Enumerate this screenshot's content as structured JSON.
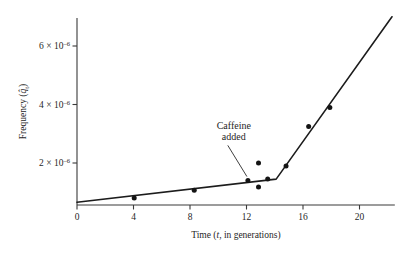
{
  "chart_data": {
    "type": "scatter",
    "title": "",
    "xlabel": "Time (t, in generations)",
    "xlabel_parts": {
      "prefix": "Time (",
      "italic": "t",
      "suffix": ", in generations)"
    },
    "ylabel": "Frequency (q̂t)",
    "ylabel_parts": {
      "prefix": "Frequency (",
      "italic": "q̂",
      "subscript": "t",
      "suffix": ")"
    },
    "xlim": [
      0,
      22.5
    ],
    "ylim": [
      0,
      7.2e-06
    ],
    "xticks": [
      0,
      4,
      8,
      12,
      16,
      20
    ],
    "xticklabels": [
      "0",
      "4",
      "8",
      "12",
      "16",
      "20"
    ],
    "yticks": [
      2e-06,
      4e-06,
      6e-06
    ],
    "yticklabels": [
      "2 × 10–6",
      "4 × 10–6",
      "6 × 10–6"
    ],
    "ytick_mantissas": [
      "2",
      "4",
      "6"
    ],
    "ytick_base": " × 10",
    "ytick_exponent": "–6",
    "grid": false,
    "legend": "none",
    "points": [
      {
        "x": 4.05,
        "y": 8e-07
      },
      {
        "x": 8.3,
        "y": 1.07e-06
      },
      {
        "x": 12.1,
        "y": 1.4e-06
      },
      {
        "x": 12.85,
        "y": 2e-06
      },
      {
        "x": 12.85,
        "y": 1.18e-06
      },
      {
        "x": 13.5,
        "y": 1.45e-06
      },
      {
        "x": 14.8,
        "y": 1.9e-06
      },
      {
        "x": 16.4,
        "y": 3.25e-06
      },
      {
        "x": 17.9,
        "y": 3.9e-06
      }
    ],
    "fit_line": {
      "name": "two-phase fitted line",
      "vertices": [
        {
          "x": 0.0,
          "y": 6.6e-07
        },
        {
          "x": 14.1,
          "y": 1.45e-06
        },
        {
          "x": 22.3,
          "y": 7e-06
        }
      ]
    },
    "annotations": [
      {
        "name": "caffeine-added",
        "line1": "Caffeine",
        "line2": "added",
        "text_x": 11.1,
        "text_y": 3.15e-06,
        "target": {
          "x": 12.1,
          "y": 1.4e-06
        }
      }
    ],
    "colors": {
      "axis": "#3a3a3a",
      "line": "#1c1c1c",
      "marker": "#141414",
      "text": "#1f1f1f",
      "background": "#ffffff"
    }
  }
}
